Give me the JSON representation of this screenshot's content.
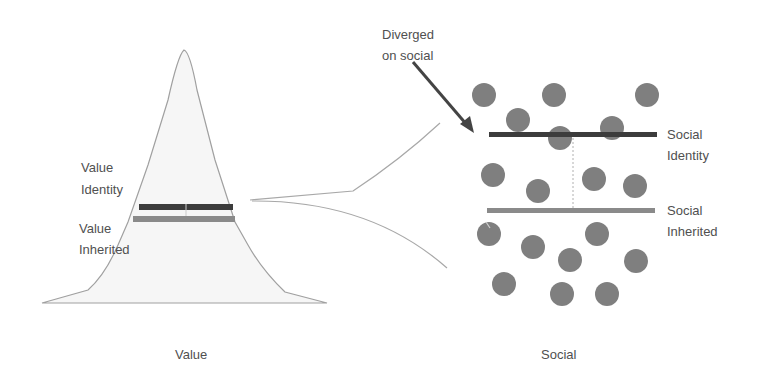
{
  "diagram": {
    "left_panel": {
      "caption": "Value",
      "labels": {
        "identity_line1": "Value",
        "identity_line2": "Identity",
        "inherited_line1": "Value",
        "inherited_line2": "Inherited"
      }
    },
    "right_panel": {
      "caption": "Social",
      "labels": {
        "identity_line1": "Social",
        "identity_line2": "Identity",
        "inherited_line1": "Social",
        "inherited_line2": "Inherited"
      },
      "dot_count": 18
    },
    "annotation": {
      "line1": "Diverged",
      "line2": "on social"
    },
    "colors": {
      "identity_bar": "#3c3c3c",
      "inherited_bar": "#8a8a8a",
      "dot": "#7f7f7f",
      "peak_fill": "#f5f5f5",
      "outline": "#9a9a9a",
      "arrow": "#444444"
    }
  }
}
